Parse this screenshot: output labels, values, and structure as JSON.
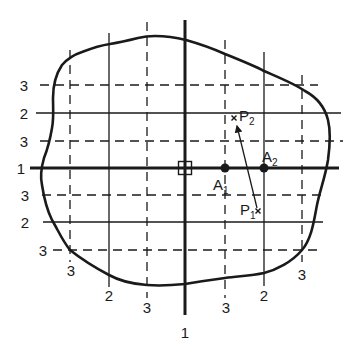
{
  "figure": {
    "type": "grid-overlay-diagram",
    "stroke_color": "#1a1a1a",
    "background": "#ffffff"
  },
  "axes": {
    "center": [
      185,
      168
    ],
    "vertical": {
      "x": 185,
      "y1": 20,
      "y2": 315
    },
    "horizontal": {
      "y": 168,
      "x1": 30,
      "x2": 339
    }
  },
  "origin_marker": {
    "shape": "square",
    "x": 185,
    "y": 168,
    "size": 13
  },
  "vertical_lines": [
    {
      "x": 70,
      "style": "dashed",
      "label": "3",
      "label_pos": [
        71,
        276
      ]
    },
    {
      "x": 109,
      "style": "solid",
      "label": "2",
      "label_pos": [
        109,
        301
      ]
    },
    {
      "x": 147,
      "style": "dashed",
      "label": "3",
      "label_pos": [
        147,
        313
      ]
    },
    {
      "x": 185,
      "style": "axis",
      "label": "1",
      "label_pos": [
        185,
        338
      ]
    },
    {
      "x": 225,
      "style": "dashed",
      "label": "3",
      "label_pos": [
        226,
        313
      ]
    },
    {
      "x": 264,
      "style": "solid",
      "label": "2",
      "label_pos": [
        264,
        301
      ]
    },
    {
      "x": 302,
      "style": "dashed",
      "label": "3",
      "label_pos": [
        302,
        280
      ]
    }
  ],
  "horizontal_lines": [
    {
      "y": 85,
      "style": "dashed",
      "label": "3",
      "label_pos": [
        25,
        91
      ]
    },
    {
      "y": 113,
      "style": "solid",
      "label": "2",
      "label_pos": [
        25,
        119
      ]
    },
    {
      "y": 141,
      "style": "dashed",
      "label": "3",
      "label_pos": [
        25,
        147
      ]
    },
    {
      "y": 168,
      "style": "axis",
      "label": "1",
      "label_pos": [
        22,
        174
      ]
    },
    {
      "y": 195,
      "style": "dashed",
      "label": "3",
      "label_pos": [
        26,
        200
      ]
    },
    {
      "y": 222,
      "style": "solid",
      "label": "2",
      "label_pos": [
        26,
        228
      ]
    },
    {
      "y": 250,
      "style": "dashed",
      "label": "3",
      "label_pos": [
        43,
        256
      ]
    }
  ],
  "points": [
    {
      "name": "A",
      "sub": "1",
      "x": 225,
      "y": 168,
      "marker": "dot",
      "label_pos": [
        213,
        190
      ]
    },
    {
      "name": "A",
      "sub": "2",
      "x": 264,
      "y": 168,
      "marker": "dot",
      "label_pos": [
        262,
        162
      ]
    },
    {
      "name": "P",
      "sub": "1",
      "x": 258,
      "y": 211,
      "marker": "cross",
      "label_pos": [
        239,
        215
      ]
    },
    {
      "name": "P",
      "sub": "2",
      "x": 234,
      "y": 118,
      "marker": "cross",
      "label_pos": [
        239,
        121
      ]
    }
  ],
  "arrow": {
    "from": "P1",
    "to": "P2",
    "x1": 258,
    "y1": 209,
    "x2": 237,
    "y2": 125
  },
  "labels": {
    "A1": "A",
    "A1_sub": "1",
    "A2": "A",
    "A2_sub": "2",
    "P1": "P",
    "P1_sub": "1",
    "P2": "P",
    "P2_sub": "2",
    "left": [
      "3",
      "2",
      "3",
      "1",
      "3",
      "2",
      "3"
    ],
    "bottom": [
      "3",
      "2",
      "3",
      "1",
      "3",
      "2",
      "3"
    ]
  }
}
